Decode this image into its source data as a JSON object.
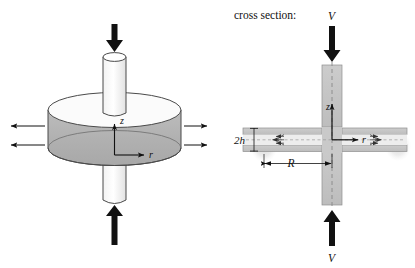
{
  "figure": {
    "caption_label": "cross section:",
    "panels": [
      {
        "id": "perspective-view",
        "name": "three-dimensional squeeze-flow disk",
        "labels": {
          "axis_z": "z",
          "axis_r": "r"
        },
        "arrows": {
          "top_force": "downward compressive load",
          "bottom_force": "upward compressive load",
          "left_outflow_count": 2,
          "right_outflow_count": 2
        }
      },
      {
        "id": "cross-section-view",
        "name": "axial cross section of squeeze flow gap",
        "labels": {
          "velocity_top": "V",
          "velocity_bottom": "V",
          "gap_height": "2h",
          "radius": "R",
          "axis_z": "z",
          "axis_r": "r"
        }
      }
    ]
  },
  "colors": {
    "ink": "#111111",
    "disk_body": "#b3b3b3",
    "disk_top": "#fbfbfb",
    "plate_gray": "#c2c2c2",
    "shaft_gray": "#c9c9c9",
    "gap_light": "#ededed",
    "blob_gray": "#e4e4e4",
    "outline": "#4a4a4a",
    "background": "#ffffff"
  }
}
